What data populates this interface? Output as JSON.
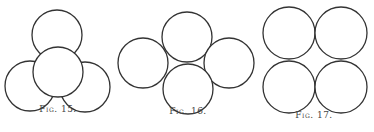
{
  "figures": [
    {
      "caption": "Fig. 15.",
      "caption_pos": [
        58,
        111
      ],
      "circles": [
        {
          "cx": 57,
          "cy": 35,
          "r": 25
        },
        {
          "cx": 30,
          "cy": 86,
          "r": 25
        },
        {
          "cx": 85,
          "cy": 87,
          "r": 25
        },
        {
          "cx": 58,
          "cy": 72,
          "r": 25
        }
      ]
    },
    {
      "caption": "Fig. 16.",
      "caption_pos": [
        188,
        113
      ],
      "circles": [
        {
          "cx": 187,
          "cy": 37,
          "r": 25
        },
        {
          "cx": 143,
          "cy": 63,
          "r": 25
        },
        {
          "cx": 229,
          "cy": 63,
          "r": 25
        },
        {
          "cx": 188,
          "cy": 89,
          "r": 25
        }
      ]
    },
    {
      "caption": "Fig. 17.",
      "caption_pos": [
        314,
        116
      ],
      "circles": [
        {
          "cx": 289,
          "cy": 33,
          "r": 26
        },
        {
          "cx": 341,
          "cy": 33,
          "r": 26
        },
        {
          "cx": 289,
          "cy": 87,
          "r": 26
        },
        {
          "cx": 341,
          "cy": 87,
          "r": 26
        }
      ]
    }
  ],
  "style": {
    "stroke": "#333333",
    "background": "#ffffff"
  }
}
